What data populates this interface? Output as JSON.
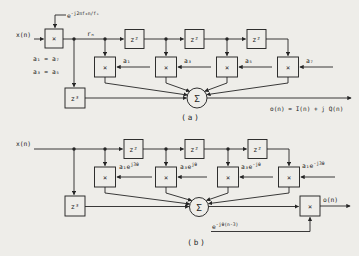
{
  "colors": {
    "background": "#eeede9",
    "ink": "#252525"
  },
  "figure": {
    "a": {
      "caption": "(a)",
      "input_label": "x(n)",
      "carrier_base": "e",
      "carrier_sup": "-j2πf₀n/fₛ",
      "signal_label": "rₙ",
      "identity_1": "a₁ = a₇",
      "identity_2": "a₃ = a₅",
      "multiplier_symbol": "×",
      "delay2": "z²",
      "delay3": "z³",
      "sum_symbol": "Σ",
      "coeff_1": "a₁",
      "coeff_2": "a₃",
      "coeff_3": "a₅",
      "coeff_4": "a₇",
      "output_label": "o(n) = I(n) + j Q(n)"
    },
    "b": {
      "caption": "(b)",
      "input_label": "x(n)",
      "multiplier_symbol": "×",
      "delay2": "z²",
      "delay3": "z³",
      "sum_symbol": "Σ",
      "coeff_1_base": "a₁e",
      "coeff_1_sup": "j3θ",
      "coeff_2_base": "a₃e",
      "coeff_2_sup": "jθ",
      "coeff_3_base": "a₃e",
      "coeff_3_sup": "-jθ",
      "coeff_4_base": "a₁e",
      "coeff_4_sup": "-j3θ",
      "post_factor_base": "e",
      "post_factor_sup": "-jθ(n-3)",
      "output_label": "o(n)"
    }
  }
}
